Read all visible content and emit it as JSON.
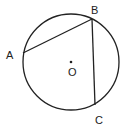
{
  "diagram": {
    "type": "circle-geometry",
    "circle": {
      "center_label": "O",
      "cx": 71,
      "cy": 62,
      "r": 48
    },
    "points": [
      {
        "name": "A",
        "x": 23,
        "y": 53,
        "label_x": 5,
        "label_y": 58
      },
      {
        "name": "B",
        "x": 92,
        "y": 19,
        "label_x": 92,
        "label_y": 13
      },
      {
        "name": "C",
        "x": 95,
        "y": 105,
        "label_x": 95,
        "label_y": 123
      }
    ],
    "segments": [
      {
        "from": "A",
        "to": "B"
      },
      {
        "from": "B",
        "to": "C"
      }
    ],
    "labels": {
      "A": "A",
      "B": "B",
      "C": "C",
      "O": "O"
    },
    "colors": {
      "stroke": "#222222",
      "background": "#ffffff"
    }
  }
}
